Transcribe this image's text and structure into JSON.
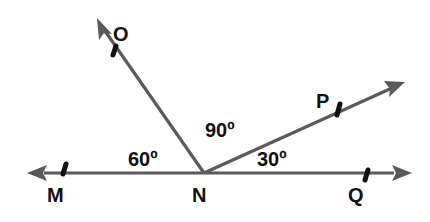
{
  "diagram": {
    "vertex": {
      "label": "N"
    },
    "points": [
      {
        "id": "M",
        "label": "M"
      },
      {
        "id": "O",
        "label": "O"
      },
      {
        "id": "P",
        "label": "P"
      },
      {
        "id": "Q",
        "label": "Q"
      }
    ],
    "angles": [
      {
        "id": "MNO",
        "label": "60º",
        "between": [
          "NM",
          "NO"
        ]
      },
      {
        "id": "ONP",
        "label": "90º",
        "between": [
          "NO",
          "NP"
        ]
      },
      {
        "id": "PNQ",
        "label": "30º",
        "between": [
          "NP",
          "NQ"
        ]
      }
    ],
    "colors": {
      "ray": "#5a5a5a",
      "tick": "#111111",
      "text": "#111111",
      "background": "#ffffff"
    }
  }
}
